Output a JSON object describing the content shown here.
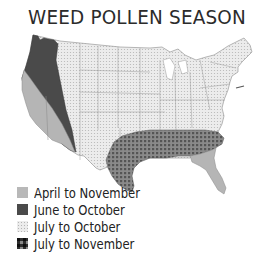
{
  "title": "WEED POLLEN SEASON",
  "legend": {
    "items": [
      {
        "label": "April to November",
        "pattern": "solid-light",
        "color": "#b8b8b8"
      },
      {
        "label": "June to October",
        "pattern": "solid-dark",
        "color": "#4a4a4a"
      },
      {
        "label": "July to October",
        "pattern": "dotted-light",
        "color": "#e6e6e6"
      },
      {
        "label": "July to November",
        "pattern": "checkered",
        "color": "#6a6a6a"
      }
    ]
  },
  "map": {
    "regions": [
      {
        "name": "Pacific Northwest and inland West",
        "season": "June to October"
      },
      {
        "name": "California coast and Southeast coast (Georgia/Florida)",
        "season": "April to November"
      },
      {
        "name": "Central, Midwest and Northeast US",
        "season": "July to October"
      },
      {
        "name": "Southern states (Texas to Carolinas)",
        "season": "July to November"
      }
    ]
  }
}
